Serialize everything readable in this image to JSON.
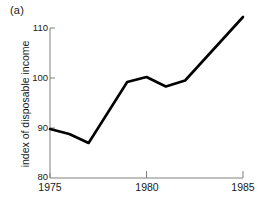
{
  "panel": {
    "label": "(a)"
  },
  "chart_data": {
    "type": "line",
    "title": "",
    "subtitle": "",
    "xlabel": "",
    "ylabel": "index of disposable income",
    "xlim": [
      1975,
      1985
    ],
    "ylim": [
      80,
      110
    ],
    "grid": false,
    "legend_position": "none",
    "x_ticks": [
      "1975",
      "1980",
      "1985"
    ],
    "x_tick_values": [
      1975,
      1980,
      1985
    ],
    "y_ticks": [
      "80",
      "90",
      "100",
      "110"
    ],
    "y_tick_values": [
      80,
      90,
      100,
      110
    ],
    "series": [
      {
        "name": "index of disposable income",
        "color": "#000000",
        "x": [
          1975,
          1976,
          1977,
          1979,
          1980,
          1981,
          1982,
          1985
        ],
        "values": [
          89.8,
          88.8,
          87.0,
          99.2,
          100.2,
          98.3,
          99.5,
          112.2
        ]
      }
    ]
  },
  "axes": {
    "line_color": "#808080",
    "data_line_color": "#000000"
  }
}
